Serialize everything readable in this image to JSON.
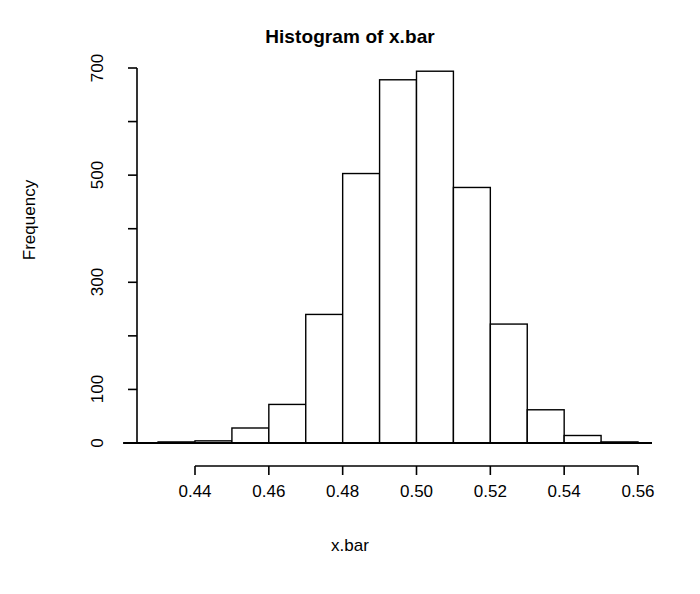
{
  "chart_data": {
    "type": "bar",
    "title": "Histogram of x.bar",
    "xlabel": "x.bar",
    "ylabel": "Frequency",
    "grid": false,
    "legend": null,
    "xlim": [
      0.43,
      0.56
    ],
    "ylim": [
      0,
      700
    ],
    "bin_width": 0.01,
    "x_tick_values": [
      0.44,
      0.46,
      0.48,
      0.5,
      0.52,
      0.54,
      0.56
    ],
    "x_tick_labels": [
      "0.44",
      "0.46",
      "0.48",
      "0.50",
      "0.52",
      "0.54",
      "0.56"
    ],
    "y_tick_values": [
      0,
      100,
      200,
      300,
      400,
      500,
      600,
      700
    ],
    "y_tick_labels": [
      "0",
      "",
      "100",
      "",
      "300",
      "",
      "500",
      "",
      "700"
    ],
    "y_labeled_ticks": [
      {
        "value": 0,
        "label": "0"
      },
      {
        "value": 100,
        "label": "100"
      },
      {
        "value": 300,
        "label": "300"
      },
      {
        "value": 500,
        "label": "500"
      },
      {
        "value": 700,
        "label": "700"
      }
    ],
    "y_minor_ticks": [
      200,
      400,
      600
    ],
    "bins": [
      {
        "left": 0.43,
        "right": 0.44,
        "value": 2
      },
      {
        "left": 0.44,
        "right": 0.45,
        "value": 4
      },
      {
        "left": 0.45,
        "right": 0.46,
        "value": 28
      },
      {
        "left": 0.46,
        "right": 0.47,
        "value": 72
      },
      {
        "left": 0.47,
        "right": 0.48,
        "value": 240
      },
      {
        "left": 0.48,
        "right": 0.49,
        "value": 503
      },
      {
        "left": 0.49,
        "right": 0.5,
        "value": 678
      },
      {
        "left": 0.5,
        "right": 0.51,
        "value": 694
      },
      {
        "left": 0.51,
        "right": 0.52,
        "value": 477
      },
      {
        "left": 0.52,
        "right": 0.53,
        "value": 222
      },
      {
        "left": 0.53,
        "right": 0.54,
        "value": 62
      },
      {
        "left": 0.54,
        "right": 0.55,
        "value": 14
      },
      {
        "left": 0.55,
        "right": 0.56,
        "value": 2
      }
    ],
    "categories": [
      "0.43-0.44",
      "0.44-0.45",
      "0.45-0.46",
      "0.46-0.47",
      "0.47-0.48",
      "0.48-0.49",
      "0.49-0.50",
      "0.50-0.51",
      "0.51-0.52",
      "0.52-0.53",
      "0.53-0.54",
      "0.54-0.55",
      "0.55-0.56"
    ],
    "values": [
      2,
      4,
      28,
      72,
      240,
      503,
      678,
      694,
      477,
      222,
      62,
      14,
      2
    ],
    "colors": {
      "bar_fill": "#ffffff",
      "bar_stroke": "#000000",
      "axis": "#000000",
      "text": "#000000",
      "background": "#ffffff"
    }
  }
}
